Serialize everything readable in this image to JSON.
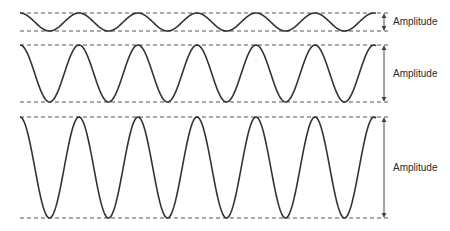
{
  "title": "",
  "colors": {
    "wave": "#333333",
    "dash": "#555555",
    "arrow": "#444444",
    "text": "#2a2a2a"
  },
  "waves": [
    {
      "id": "small",
      "label": "Amplitude",
      "top": 13,
      "bottom": 31,
      "label_y": 17
    },
    {
      "id": "medium",
      "label": "Amplitude",
      "top": 45,
      "bottom": 102,
      "label_y": 69
    },
    {
      "id": "large",
      "label": "Amplitude",
      "top": 117,
      "bottom": 218,
      "label_y": 163
    }
  ],
  "x_start": 20,
  "x_end": 376,
  "period": 59,
  "arrow_x": 384,
  "label_x": 393
}
